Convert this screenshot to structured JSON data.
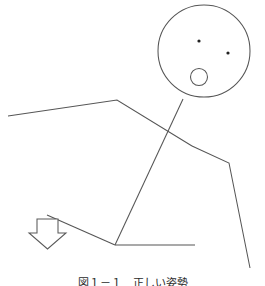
{
  "figure": {
    "type": "line-drawing",
    "background_color": "#ffffff",
    "stroke_color": "#555555",
    "canvas": {
      "width": 265,
      "height": 286
    },
    "caption": {
      "text": "図１－１　正しい姿勢",
      "clipped": true,
      "note": "caption is cut off at the bottom edge of the image; only the topmost pixel row of the glyphs is visible"
    },
    "parts": {
      "head": {
        "label": "head-circle",
        "center_x": 204,
        "center_y": 51,
        "radius": 46
      },
      "eye_left": {
        "label": "left-eye-dot",
        "cx": 199,
        "cy": 41,
        "r": 1.6
      },
      "eye_right": {
        "label": "right-eye-dot",
        "cx": 228,
        "cy": 53,
        "r": 1.6
      },
      "mouth": {
        "label": "mouth-circle",
        "cx": 199,
        "cy": 77,
        "r": 8.5
      },
      "neck": {
        "label": "neck-line",
        "points": "183,99 151,146"
      },
      "left_arm": {
        "label": "left-arm-polyline",
        "points": "8,116 117,100 192,146"
      },
      "right_arm": {
        "label": "right-arm-polyline",
        "points": "192,146 229,163 250,268"
      },
      "torso": {
        "label": "torso-line",
        "points": "183,99 115,245"
      },
      "ground_line": {
        "label": "ground-horizontal-line",
        "points": "115,245 195,245"
      },
      "slope_line": {
        "label": "slope-line",
        "points": "47,215 115,245"
      },
      "down_arrow": {
        "label": "down-arrow",
        "points": "37,219 58,219 58,233 66,233 47.5,249 29,233 37,233",
        "direction": "down"
      }
    }
  }
}
